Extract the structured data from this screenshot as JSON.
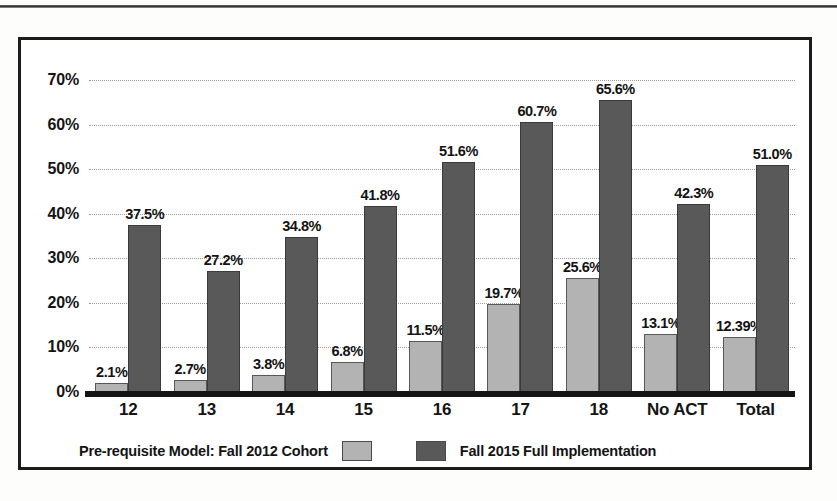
{
  "page": {
    "top_rule_present": true,
    "cropped_caption_fragment": ""
  },
  "figure": {
    "frame_border_color": "#1c1c1c",
    "background": "#ffffff"
  },
  "colors": {
    "series_light": "#b3b3b3",
    "series_dark": "#595959",
    "axis": "#141414",
    "gridline": "#9d9d9d"
  },
  "chart_data": {
    "type": "bar",
    "title": "",
    "subtitle": "",
    "xlabel": "",
    "ylabel": "",
    "ylim": [
      0,
      75
    ],
    "grid": true,
    "legend_position": "bottom",
    "categories": [
      "12",
      "13",
      "14",
      "15",
      "16",
      "17",
      "18",
      "No ACT",
      "Total"
    ],
    "ytick_labels": [
      "0%",
      "10%",
      "20%",
      "30%",
      "40%",
      "50%",
      "60%",
      "70%"
    ],
    "ytick_values": [
      0,
      10,
      20,
      30,
      40,
      50,
      60,
      70
    ],
    "series": [
      {
        "name": "Pre-requisite Model: Fall 2012 Cohort",
        "color": "#b3b3b3",
        "values": [
          2.1,
          2.7,
          3.8,
          6.8,
          11.5,
          19.7,
          25.6,
          13.1,
          12.39
        ],
        "labels": [
          "2.1%",
          "2.7%",
          "3.8%",
          "6.8%",
          "11.5%",
          "19.7%",
          "25.6%",
          "13.1%",
          "12.39%"
        ]
      },
      {
        "name": "Fall 2015 Full Implementation",
        "color": "#595959",
        "values": [
          37.5,
          27.2,
          34.8,
          41.8,
          51.6,
          60.7,
          65.6,
          42.3,
          51.0
        ],
        "labels": [
          "37.5%",
          "27.2%",
          "34.8%",
          "41.8%",
          "51.6%",
          "60.7%",
          "65.6%",
          "42.3%",
          "51.0%"
        ]
      }
    ]
  }
}
